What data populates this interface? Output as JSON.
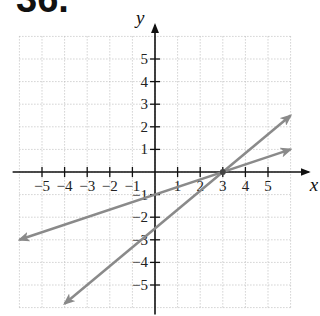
{
  "problem_number": "36.",
  "chart_data": {
    "type": "line",
    "title": "",
    "xlabel": "x",
    "ylabel": "y",
    "xlim": [
      -6,
      6
    ],
    "ylim": [
      -6,
      6
    ],
    "grid": true,
    "x_ticks": [
      -5,
      -4,
      -3,
      -2,
      -1,
      1,
      2,
      3,
      4,
      5
    ],
    "y_ticks": [
      -5,
      -4,
      -3,
      -2,
      -1,
      1,
      2,
      3,
      4,
      5
    ],
    "series": [
      {
        "name": "line 1 (y = x/3 - 1)",
        "x": [
          -6,
          6
        ],
        "y": [
          -3,
          1
        ],
        "slope": 0.3333,
        "y_intercept": -1,
        "x_intercept": 3
      },
      {
        "name": "line 2 (y = 5x/6 - 2.5)",
        "x": [
          -4,
          6
        ],
        "y": [
          -5.83,
          2.5
        ],
        "slope": 0.8333,
        "y_intercept": -2.5,
        "x_intercept": 3
      }
    ],
    "intersection": [
      3,
      0
    ],
    "line_color": "#8a8a8a"
  }
}
